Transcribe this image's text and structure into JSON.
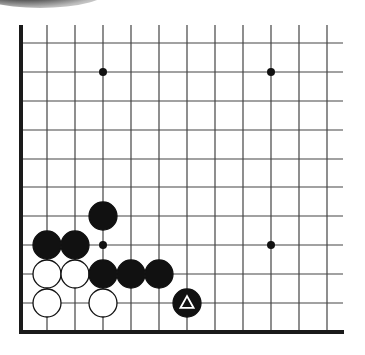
{
  "board": {
    "description": "Go problem diagram, lower-left corner of the board",
    "colors": {
      "background": "#ffffff",
      "line": "#444444",
      "border": "#1a1a1a",
      "black_stone": "#111111",
      "white_stone": "#ffffff",
      "stone_outline": "#111111",
      "marker": "#ffffff"
    },
    "grid": {
      "columns_x": [
        47,
        75,
        103,
        131,
        159,
        187,
        215,
        243,
        271,
        299,
        327
      ],
      "rows_y": [
        43,
        72,
        101,
        130,
        159,
        187,
        216,
        245,
        274,
        303
      ],
      "left_border_x": 21,
      "bottom_border_y": 332,
      "top_y": 25,
      "right_end_x": 343
    },
    "star_points": [
      {
        "col": 2,
        "row": 1
      },
      {
        "col": 8,
        "row": 1
      },
      {
        "col": 2,
        "row": 7
      },
      {
        "col": 8,
        "row": 7
      }
    ],
    "stones": [
      {
        "color": "black",
        "col": 2,
        "row": 6
      },
      {
        "color": "black",
        "col": 0,
        "row": 7
      },
      {
        "color": "black",
        "col": 1,
        "row": 7
      },
      {
        "color": "white",
        "col": 0,
        "row": 8
      },
      {
        "color": "white",
        "col": 1,
        "row": 8
      },
      {
        "color": "black",
        "col": 2,
        "row": 8
      },
      {
        "color": "black",
        "col": 3,
        "row": 8
      },
      {
        "color": "black",
        "col": 4,
        "row": 8
      },
      {
        "color": "white",
        "col": 0,
        "row": 9
      },
      {
        "color": "white",
        "col": 2,
        "row": 9
      },
      {
        "color": "black",
        "col": 5,
        "row": 9,
        "marker": "triangle"
      }
    ],
    "stone_radius": 14
  }
}
